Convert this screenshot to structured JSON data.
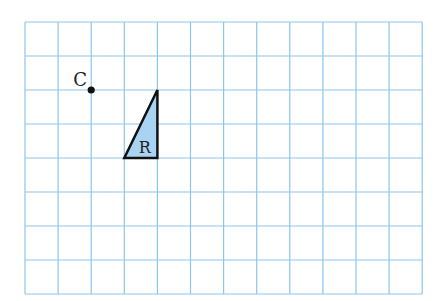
{
  "grid": {
    "left": 25,
    "top": 22,
    "cols": 12,
    "rows": 8,
    "cell_w": 33.1,
    "cell_h": 34,
    "line_color": "#8ec5ea"
  },
  "point": {
    "label": "C",
    "grid_x": 2,
    "grid_y": 2,
    "color": "#111111"
  },
  "shape": {
    "label": "R",
    "type": "right-triangle",
    "vertices_grid": [
      [
        4,
        2
      ],
      [
        3,
        4
      ],
      [
        4,
        4
      ]
    ],
    "fill": "#a9d3f3",
    "stroke": "#111111"
  }
}
